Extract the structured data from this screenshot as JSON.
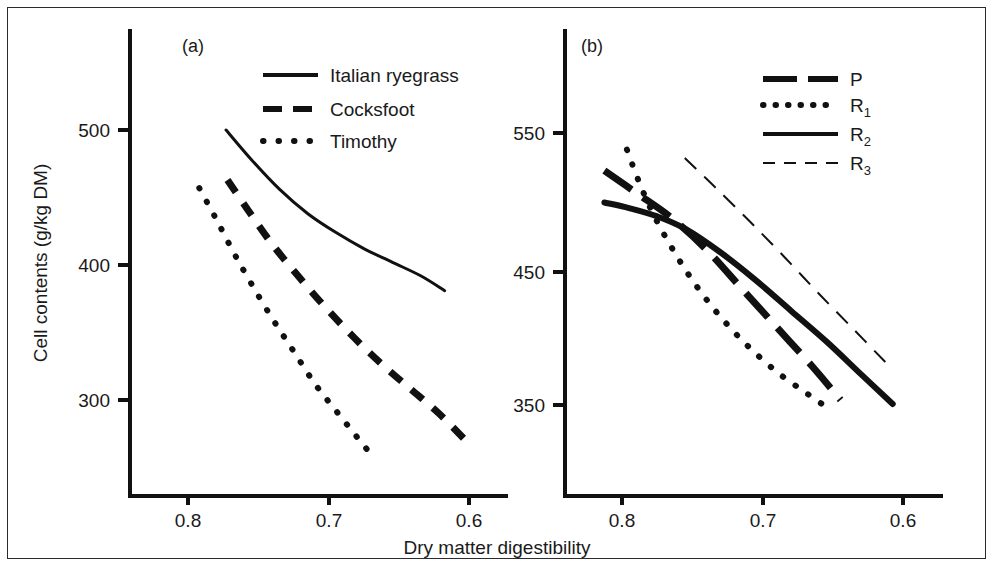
{
  "figure": {
    "width": 994,
    "height": 567,
    "background_color": "#ffffff",
    "border_color": "#2b2b2b",
    "ink_color": "#111111"
  },
  "shared_axis": {
    "xlabel": "Dry matter digestibility",
    "ylabel": "Cell contents (g/kg DM)",
    "xticks": [
      "0.8",
      "0.7",
      "0.6"
    ],
    "xtick_values": [
      0.8,
      0.7,
      0.6
    ]
  },
  "panels": {
    "a": {
      "label": "(a)",
      "yticks": [
        "500",
        "400",
        "300"
      ],
      "ytick_values": [
        500,
        400,
        300
      ]
    },
    "b": {
      "label": "(b)",
      "yticks": [
        "550",
        "450",
        "350"
      ],
      "ytick_values": [
        550,
        450,
        350
      ]
    }
  },
  "legend_a": {
    "items": [
      {
        "label": "Italian ryegrass",
        "style": "solid"
      },
      {
        "label": "Cocksfoot",
        "style": "dashed"
      },
      {
        "label": "Timothy",
        "style": "dotted"
      }
    ]
  },
  "legend_b": {
    "items": [
      {
        "label": "P",
        "sub": "",
        "style": "thick-dashed"
      },
      {
        "label": "R",
        "sub": "1",
        "style": "dotted"
      },
      {
        "label": "R",
        "sub": "2",
        "style": "solid"
      },
      {
        "label": "R",
        "sub": "3",
        "style": "thin-dashed"
      }
    ]
  },
  "chart_data": [
    {
      "type": "line",
      "title": "(a)",
      "xlabel": "Dry matter digestibility",
      "ylabel": "Cell contents (g/kg DM)",
      "xlim": [
        0.83,
        0.58
      ],
      "ylim": [
        240,
        560
      ],
      "xticks": [
        0.8,
        0.7,
        0.6
      ],
      "yticks": [
        500,
        400,
        300
      ],
      "grid": false,
      "legend_position": "top-right",
      "series": [
        {
          "name": "Italian ryegrass",
          "style": "solid",
          "x": [
            0.773,
            0.755,
            0.735,
            0.715,
            0.695,
            0.675,
            0.655,
            0.635,
            0.618
          ],
          "y": [
            500,
            478,
            456,
            438,
            424,
            412,
            402,
            392,
            381
          ]
        },
        {
          "name": "Cocksfoot",
          "style": "dashed",
          "x": [
            0.772,
            0.757,
            0.74,
            0.722,
            0.702,
            0.682,
            0.662,
            0.642,
            0.622,
            0.604
          ],
          "y": [
            463,
            440,
            415,
            392,
            368,
            346,
            326,
            308,
            290,
            271
          ]
        },
        {
          "name": "Timothy",
          "style": "dotted",
          "x": [
            0.792,
            0.78,
            0.768,
            0.755,
            0.74,
            0.725,
            0.71,
            0.695,
            0.682,
            0.672
          ],
          "y": [
            457,
            434,
            410,
            386,
            360,
            336,
            312,
            292,
            275,
            262
          ]
        }
      ]
    },
    {
      "type": "line",
      "title": "(b)",
      "xlabel": "Dry matter digestibility",
      "ylabel": "Cell contents (g/kg DM)",
      "xlim": [
        0.835,
        0.575
      ],
      "ylim": [
        320,
        580
      ],
      "xticks": [
        0.8,
        0.7,
        0.6
      ],
      "yticks": [
        550,
        450,
        350
      ],
      "grid": false,
      "legend_position": "top-right",
      "series": [
        {
          "name": "P",
          "style": "thick-dashed",
          "x": [
            0.8125,
            0.79,
            0.765,
            0.74,
            0.715,
            0.69,
            0.665,
            0.645
          ],
          "y": [
            523,
            507,
            489,
            466,
            438,
            410,
            382,
            358
          ]
        },
        {
          "name": "R1",
          "style": "dotted",
          "x": [
            0.7965,
            0.788,
            0.778,
            0.765,
            0.75,
            0.732,
            0.712,
            0.69,
            0.668,
            0.651
          ],
          "y": [
            538,
            515,
            492,
            468,
            444,
            420,
            398,
            378,
            362,
            350
          ]
        },
        {
          "name": "R2",
          "style": "solid",
          "x": [
            0.8125,
            0.795,
            0.775,
            0.755,
            0.73,
            0.705,
            0.68,
            0.655,
            0.63,
            0.608
          ],
          "y": [
            500,
            496,
            490,
            481,
            464,
            444,
            422,
            400,
            376,
            355
          ]
        },
        {
          "name": "R3",
          "style": "thin-dashed",
          "x": [
            0.7555,
            0.735,
            0.71,
            0.685,
            0.66,
            0.635,
            0.613
          ],
          "y": [
            532,
            512,
            487,
            461,
            434,
            408,
            385
          ]
        }
      ]
    }
  ]
}
